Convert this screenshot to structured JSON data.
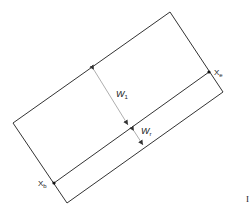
{
  "diagram": {
    "type": "tilted-rectangle-strip",
    "labels": {
      "w1": {
        "main": "W",
        "sub": "1"
      },
      "wr": {
        "main": "W",
        "sub": "r"
      },
      "xe": {
        "main": "X",
        "sub": "e"
      },
      "xb": {
        "main": "X",
        "sub": "b"
      },
      "edge_mark": "I"
    },
    "colors": {
      "stroke": "#333333",
      "arrow": "#777777",
      "background": "#ffffff"
    }
  }
}
